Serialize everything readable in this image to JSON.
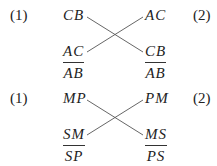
{
  "blocks": [
    {
      "label_left": "(1)",
      "label_right": "(2)",
      "top_left": "CB",
      "top_right": "AC",
      "bottom_left": {
        "numerator": "AC",
        "denominator": "AB"
      },
      "bottom_right": {
        "numerator": "CB",
        "denominator": "AB"
      }
    },
    {
      "label_left": "(1)",
      "label_right": "(2)",
      "top_left": "MP",
      "top_right": "PM",
      "bottom_left": {
        "numerator": "SM",
        "denominator": "SP"
      },
      "bottom_right": {
        "numerator": "MS",
        "denominator": "PS"
      }
    }
  ]
}
